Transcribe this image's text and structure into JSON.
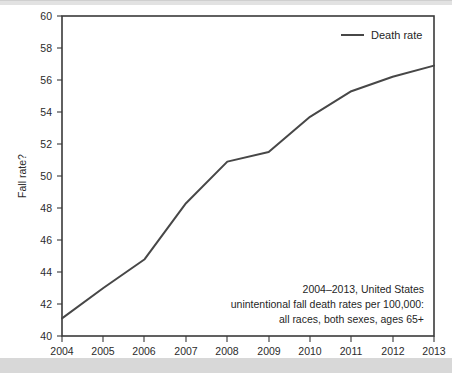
{
  "chart_data": {
    "type": "line",
    "title": "",
    "xlabel": "",
    "ylabel": "Fall rate?",
    "categories": [
      "2004",
      "2005",
      "2006",
      "2007",
      "2008",
      "2009",
      "2010",
      "2011",
      "2012",
      "2013"
    ],
    "x": [
      2004,
      2005,
      2006,
      2007,
      2008,
      2009,
      2010,
      2011,
      2012,
      2013
    ],
    "series": [
      {
        "name": "Death rate",
        "values": [
          41.1,
          43.0,
          44.8,
          48.3,
          50.9,
          51.5,
          53.7,
          55.3,
          56.2,
          56.9
        ],
        "color": "#474747"
      }
    ],
    "ylim": [
      40,
      60
    ],
    "yticks": [
      40,
      42,
      44,
      46,
      48,
      50,
      52,
      54,
      56,
      58,
      60
    ],
    "ytick_labels": [
      "40",
      "42",
      "44",
      "46",
      "48",
      "50",
      "52",
      "54",
      "56",
      "58",
      "60"
    ],
    "xlim": [
      2004,
      2013
    ],
    "xticks": [
      2004,
      2005,
      2006,
      2007,
      2008,
      2009,
      2010,
      2011,
      2012,
      2013
    ],
    "xtick_labels": [
      "2004",
      "2005",
      "2006",
      "2007",
      "2008",
      "2009",
      "2010",
      "2011",
      "2012",
      "2013"
    ],
    "grid": false,
    "legend_position": "top-right",
    "legend_entries": [
      "Death rate"
    ],
    "annotation_lines": [
      "2004–2013, United States",
      "unintentional fall death rates per 100,000:",
      "all races, both sexes, ages 65+"
    ],
    "annotation_align": "right"
  },
  "legend": {
    "death_rate_label": "Death rate"
  },
  "axes": {
    "y_axis_title": "Fall rate?"
  },
  "annotation": {
    "line1": "2004–2013, United States",
    "line2": "unintentional fall death rates per 100,000:",
    "line3": "all races, both sexes, ages 65+"
  },
  "ticks": {
    "y": [
      "60",
      "58",
      "56",
      "54",
      "52",
      "50",
      "48",
      "46",
      "44",
      "42",
      "40"
    ],
    "x": [
      "2004",
      "2005",
      "2006",
      "2007",
      "2008",
      "2009",
      "2010",
      "2011",
      "2012",
      "2013"
    ]
  }
}
